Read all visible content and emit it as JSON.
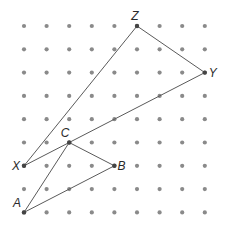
{
  "diagram": {
    "type": "dot-grid-geometry",
    "grid": {
      "cols": 9,
      "rows": 9,
      "x0": 24,
      "y0": 26,
      "dx": 22.6,
      "dy": 23.3,
      "dot_color": "#8a8a8a",
      "dot_radius": 2.1
    },
    "line_color": "#5a5a5a",
    "points": [
      {
        "name": "Z",
        "col": 5,
        "row": 0,
        "label_dx": -2,
        "label_dy": -6,
        "anchor": "middle"
      },
      {
        "name": "Y",
        "col": 8,
        "row": 2,
        "label_dx": 4,
        "label_dy": 4,
        "anchor": "start"
      },
      {
        "name": "X",
        "col": 0,
        "row": 6,
        "label_dx": -4,
        "label_dy": 4,
        "anchor": "end"
      },
      {
        "name": "C",
        "col": 2,
        "row": 5,
        "label_dx": -4,
        "label_dy": -6,
        "anchor": "middle"
      },
      {
        "name": "B",
        "col": 4,
        "row": 6,
        "label_dx": 3,
        "label_dy": 4,
        "anchor": "start"
      },
      {
        "name": "A",
        "col": 0,
        "row": 8,
        "label_dx": -3,
        "label_dy": -5,
        "anchor": "end"
      }
    ],
    "triangles": [
      {
        "name": "XYZ",
        "vertices": [
          "X",
          "Y",
          "Z"
        ]
      },
      {
        "name": "ABC",
        "vertices": [
          "A",
          "B",
          "C"
        ]
      }
    ]
  }
}
